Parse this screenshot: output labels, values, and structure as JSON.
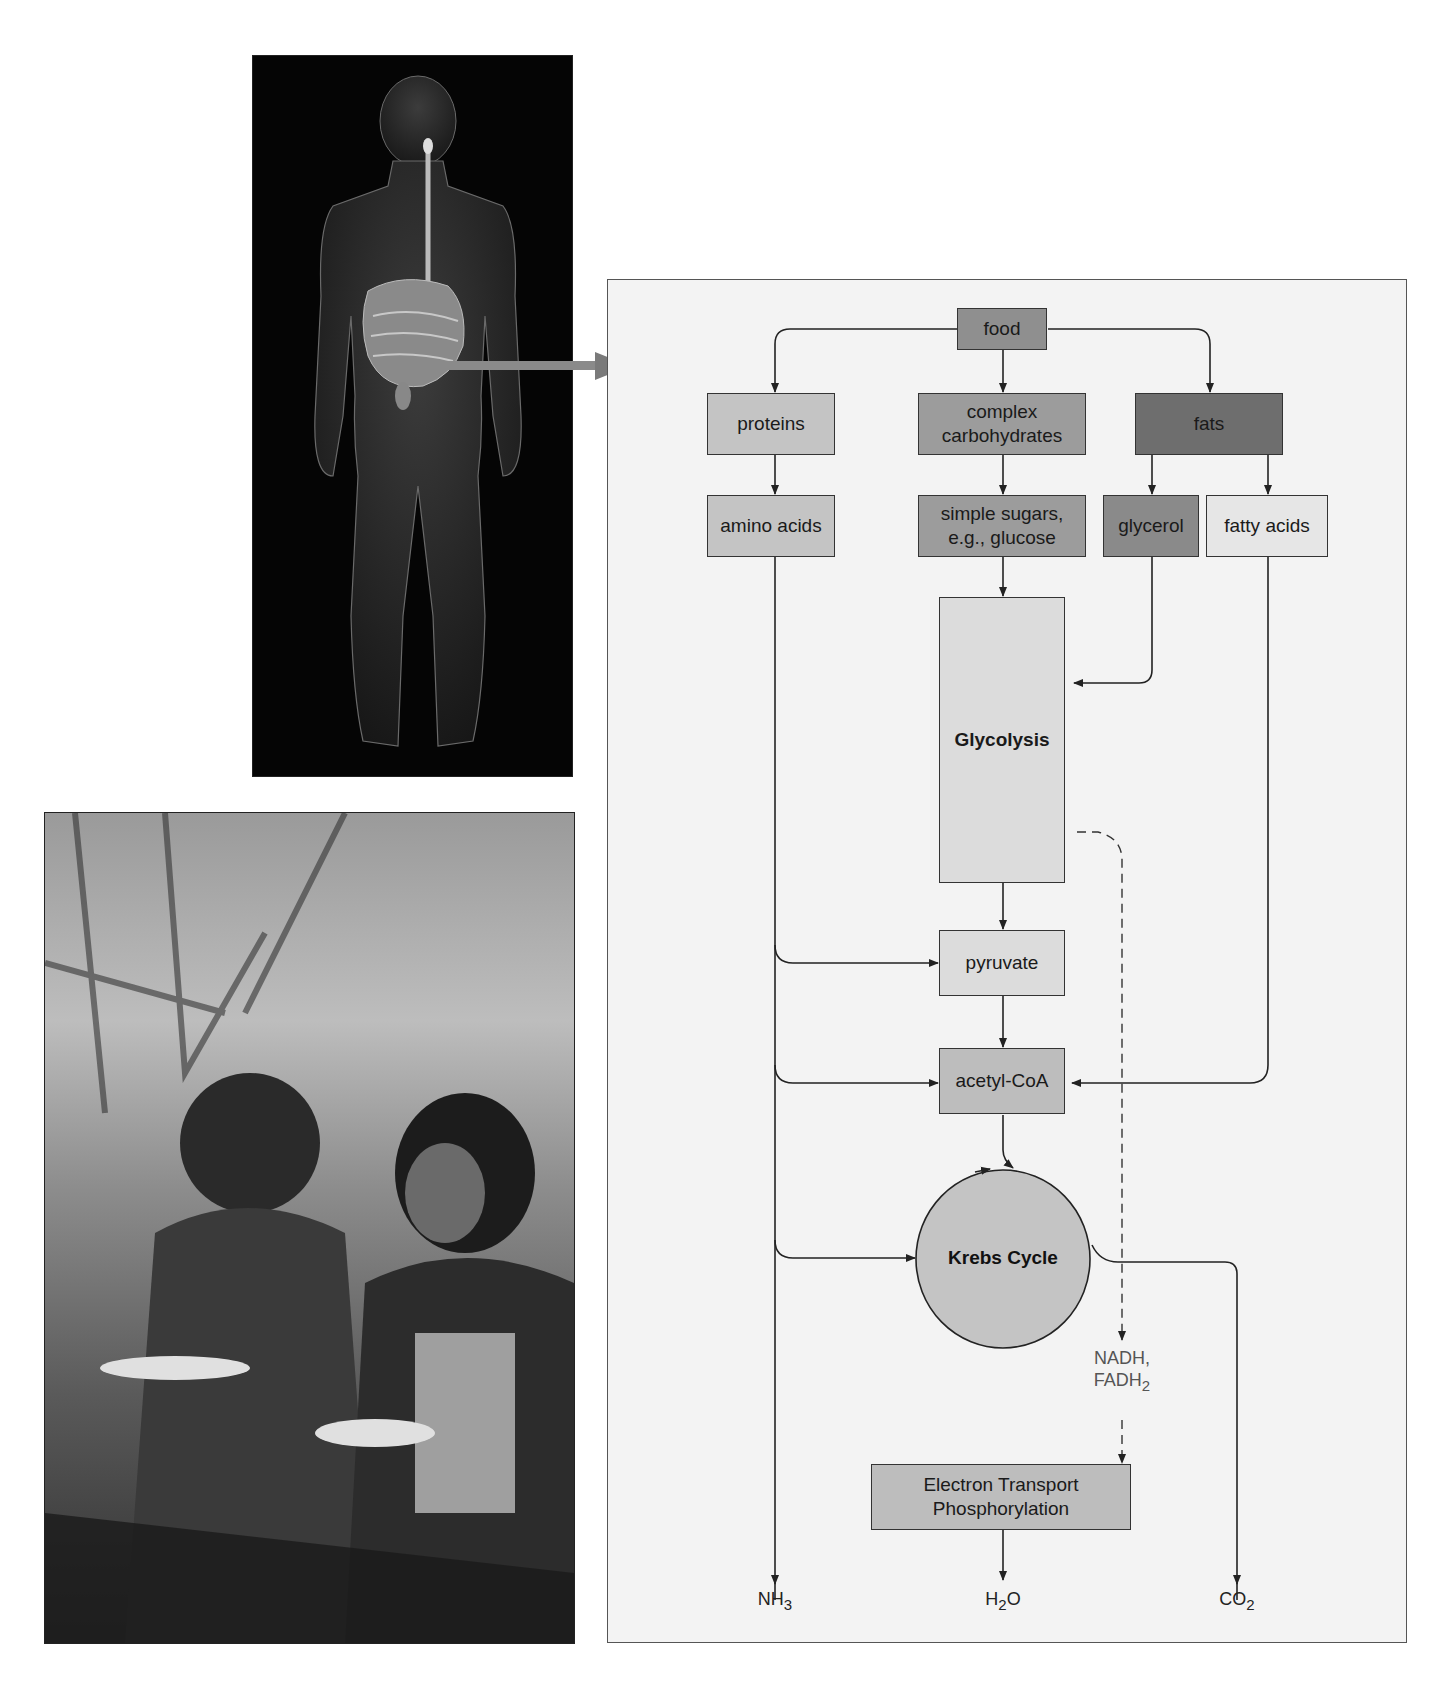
{
  "figure": {
    "photos": [
      {
        "name": "human-digestive-system",
        "description": "Silhouette of human body with digestive tract highlighted"
      },
      {
        "name": "people-eating",
        "description": "Two young people eating food outdoors"
      }
    ],
    "diagram": {
      "nodes": {
        "food": "food",
        "proteins": "proteins",
        "complex_carbs_line1": "complex",
        "complex_carbs_line2": "carbohydrates",
        "fats": "fats",
        "amino_acids": "amino acids",
        "simple_sugars_line1": "simple sugars,",
        "simple_sugars_line2": "e.g., glucose",
        "glycerol": "glycerol",
        "fatty_acids": "fatty acids",
        "glycolysis": "Glycolysis",
        "pyruvate": "pyruvate",
        "acetyl_coa": "acetyl-CoA",
        "krebs": "Krebs Cycle",
        "etp_line1": "Electron Transport",
        "etp_line2": "Phosphorylation"
      },
      "carriers": {
        "line1": "NADH,",
        "line2_base": "FADH",
        "line2_sub": "2"
      },
      "products": [
        {
          "base": "NH",
          "sub": "3"
        },
        {
          "base": "H",
          "sub": "2",
          "tail": "O"
        },
        {
          "base": "CO",
          "sub": "2"
        }
      ],
      "colors": {
        "panel_bg": "#f3f3f3",
        "food": "#8f8f8f",
        "proteins": "#c4c4c4",
        "complex_carbs": "#9c9c9c",
        "fats": "#6e6e6e",
        "amino_acids": "#c4c4c4",
        "simple_sugars": "#9c9c9c",
        "glycerol": "#8a8a8a",
        "fatty_acids": "#e6e6e6",
        "glycolysis": "#dcdcdc",
        "pyruvate": "#dcdcdc",
        "acetyl_coa": "#bdbdbd",
        "krebs": "#c4c4c4",
        "etp": "#bdbdbd"
      }
    }
  }
}
